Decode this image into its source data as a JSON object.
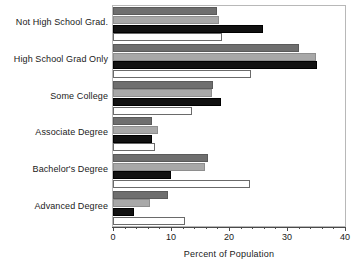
{
  "chart_data": {
    "type": "bar",
    "orientation": "horizontal",
    "title": "",
    "xlabel": "Percent of Population",
    "ylabel": "",
    "xlim": [
      0,
      40
    ],
    "ylim": null,
    "grid": false,
    "legend": null,
    "xticks": [
      0,
      10,
      20,
      30,
      40
    ],
    "xtick_labels": [
      "0",
      "10",
      "20",
      "30",
      "40"
    ],
    "xtick_minor_step": 2,
    "categories": [
      "Not High School Grad.",
      "High School Grad Only",
      "Some College",
      "Associate Degree",
      "Bachelor's Degree",
      "Advanced Degree"
    ],
    "series": [
      {
        "name": "series-1",
        "color": "#6e6e6e",
        "values": [
          18.0,
          32.0,
          17.2,
          6.7,
          16.3,
          9.5
        ]
      },
      {
        "name": "series-2",
        "color": "#a8a8a8",
        "values": [
          18.3,
          35.0,
          17.0,
          7.8,
          15.8,
          6.4
        ]
      },
      {
        "name": "series-3",
        "color": "#111111",
        "values": [
          25.8,
          35.2,
          18.7,
          6.8,
          10.0,
          3.6
        ]
      },
      {
        "name": "series-4",
        "color": "#ffffff",
        "values": [
          18.8,
          23.8,
          13.7,
          7.3,
          23.7,
          12.4
        ]
      }
    ]
  },
  "axis": {
    "x_title": "Percent of Population"
  }
}
